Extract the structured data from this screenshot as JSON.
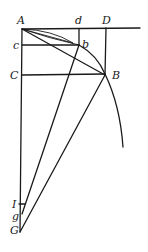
{
  "diagram": {
    "type": "geometric-construction",
    "points": [
      {
        "id": "A",
        "label": "A"
      },
      {
        "id": "d",
        "label": "d"
      },
      {
        "id": "D",
        "label": "D"
      },
      {
        "id": "c",
        "label": "c"
      },
      {
        "id": "b",
        "label": "b"
      },
      {
        "id": "C",
        "label": "C"
      },
      {
        "id": "B",
        "label": "B"
      },
      {
        "id": "I",
        "label": "I"
      },
      {
        "id": "g",
        "label": "g"
      },
      {
        "id": "G",
        "label": "G"
      }
    ],
    "segments": [
      {
        "name": "AD-tangent",
        "from": "A",
        "to": "D",
        "extended": true
      },
      {
        "name": "AG-axis",
        "from": "A",
        "to": "G"
      },
      {
        "name": "db",
        "from": "d",
        "to": "b"
      },
      {
        "name": "DB",
        "from": "D",
        "to": "B"
      },
      {
        "name": "cb",
        "from": "c",
        "to": "b"
      },
      {
        "name": "CB",
        "from": "C",
        "to": "B"
      },
      {
        "name": "Ab-chord",
        "from": "A",
        "to": "b"
      },
      {
        "name": "AB-chord",
        "from": "A",
        "to": "B"
      },
      {
        "name": "bg",
        "from": "b",
        "to": "g"
      },
      {
        "name": "BG",
        "from": "B",
        "to": "G"
      }
    ],
    "curves": [
      {
        "name": "arc-Ab",
        "from": "A",
        "to": "b"
      },
      {
        "name": "arc-AbB",
        "from": "A",
        "through": "b",
        "to": "B",
        "continues": true
      }
    ]
  }
}
